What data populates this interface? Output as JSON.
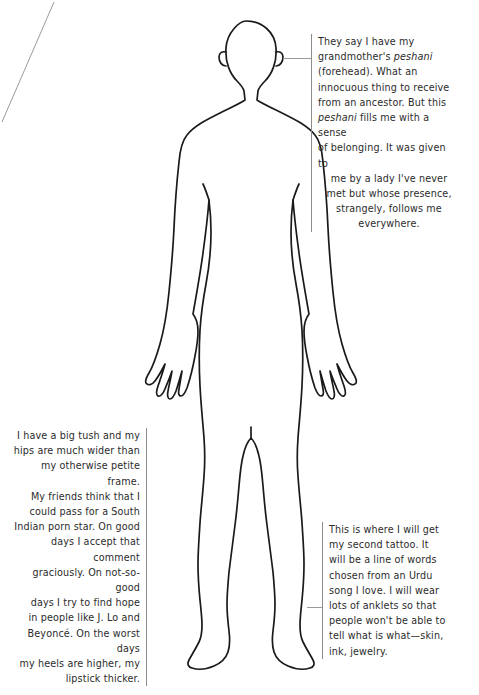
{
  "page": {
    "background_color": "#ffffff",
    "text_color": "#2b2b2b",
    "rule_color": "#8d8d8d",
    "leader_color": "#9a9a9a",
    "outline_color": "#1a1a1a",
    "width": 479,
    "height": 695
  },
  "figure": {
    "name": "human-body-outline",
    "fill": "none",
    "stroke": "#1a1a1a"
  },
  "annotations": [
    {
      "id": "forehead",
      "anchor": "forehead",
      "align": "left",
      "rule_side": "left",
      "lines": [
        "They say I have my",
        "grandmother's peshani",
        "(forehead). What an",
        "innocuous thing to receive",
        "from an ancestor. But this",
        "peshani fills me with a sense",
        "of belonging. It was given to"
      ],
      "tail_lines": [
        "me by a lady I've never",
        "met but whose presence,",
        "strangely, follows me",
        "everywhere."
      ],
      "italic_words": [
        "peshani"
      ],
      "full_text": "They say I have my grandmother's peshani (forehead). What an innocuous thing to receive from an ancestor. But this peshani fills me with a sense of belonging. It was given to me by a lady I've never met but whose presence, strangely, follows me everywhere."
    },
    {
      "id": "hips",
      "anchor": "hip",
      "align": "right",
      "rule_side": "right",
      "lines": [
        "I have a big tush and my",
        "hips are much wider than",
        "my otherwise petite frame.",
        "My friends think that I",
        "could pass for a South",
        "Indian porn star. On good",
        "days I accept that comment",
        "graciously. On not-so-good",
        "days I try to find hope",
        "in people like J. Lo and",
        "Beyoncé. On the worst days",
        "my heels are higher, my",
        "lipstick thicker."
      ],
      "full_text": "I have a big tush and my hips are much wider than my otherwise petite frame. My friends think that I could pass for a South Indian porn star. On good days I accept that comment graciously. On not-so-good days I try to find hope in people like J. Lo and Beyoncé. On the worst days my heels are higher, my lipstick thicker."
    },
    {
      "id": "ankle",
      "anchor": "ankle",
      "align": "left",
      "rule_side": "left",
      "lines": [
        "This is where I will get",
        "my second tattoo. It",
        "will be a line of words",
        "chosen from an Urdu",
        "song I love. I will wear",
        "lots of anklets so that",
        "people won't be able to",
        "tell what is what—skin,",
        "ink, jewelry."
      ],
      "full_text": "This is where I will get my second tattoo. It will be a line of words chosen from an Urdu song I love. I will wear lots of anklets so that people won't be able to tell what is what—skin, ink, jewelry."
    }
  ],
  "leaders": [
    {
      "id": "leader-forehead",
      "from": "forehead",
      "to": "ann-forehead",
      "style": "horizontal"
    },
    {
      "id": "leader-ankle",
      "from": "right-ankle",
      "to": "ann-ankle",
      "style": "horizontal"
    },
    {
      "id": "leader-hips",
      "from": "left-hip",
      "to": "ann-hips",
      "style": "diagonal"
    }
  ]
}
